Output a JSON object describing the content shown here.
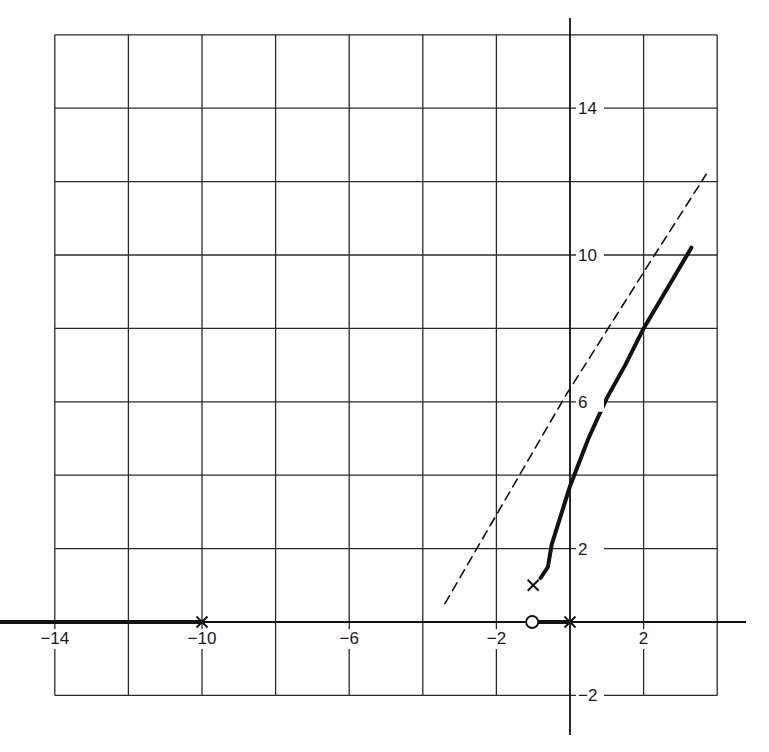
{
  "chart_data": {
    "type": "line",
    "title": "",
    "subtitle": "",
    "xlabel": "",
    "ylabel": "",
    "xlim": [
      -15.5,
      4.5
    ],
    "ylim": [
      -3.0,
      16.0
    ],
    "grid": true,
    "grid_spacing": 2,
    "legend": null,
    "x_tick_labels": [
      "-14",
      "-10",
      "-6",
      "-2",
      "2"
    ],
    "x_tick_values": [
      -14,
      -10,
      -6,
      -2,
      2
    ],
    "y_tick_labels": [
      "14",
      "10",
      "6",
      "2",
      "-2"
    ],
    "y_tick_values": [
      14,
      10,
      6,
      2,
      -2
    ],
    "poles": [
      {
        "label": "x",
        "re": -10,
        "im": 0
      },
      {
        "label": "x",
        "re": 0,
        "im": 0
      },
      {
        "label": "x",
        "re": -1,
        "im": 1
      }
    ],
    "zeros": [
      {
        "label": "o",
        "re": -1,
        "im": 0
      }
    ],
    "series": [
      {
        "name": "real-axis locus (left of -10)",
        "style": "thick solid",
        "points": [
          [
            -15.5,
            0
          ],
          [
            -10,
            0
          ]
        ]
      },
      {
        "name": "real-axis locus (zero to origin)",
        "style": "thick solid",
        "points": [
          [
            -0.9,
            0
          ],
          [
            0,
            0
          ]
        ]
      },
      {
        "name": "complex branch",
        "style": "thick solid",
        "points": [
          [
            -0.8,
            1.2
          ],
          [
            -0.6,
            1.5
          ],
          [
            -0.5,
            2.1
          ],
          [
            0,
            3.7
          ],
          [
            0.5,
            5.0
          ],
          [
            1.0,
            6.1
          ],
          [
            1.5,
            7.0
          ],
          [
            2.0,
            8.0
          ],
          [
            3.3,
            10.2
          ]
        ]
      },
      {
        "name": "asymptote",
        "style": "dashed",
        "points": [
          [
            -3.4,
            0.5
          ],
          [
            -0.1,
            6.2
          ],
          [
            2.3,
            10.0
          ],
          [
            3.7,
            12.2
          ]
        ]
      }
    ]
  }
}
